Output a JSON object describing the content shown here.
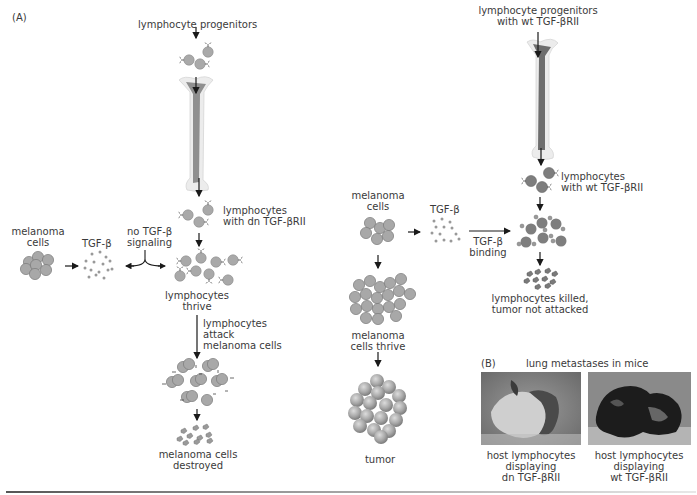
{
  "panel_a": {
    "label": "(A)",
    "progenitors": "lymphocyte progenitors",
    "lymphocytes_dn": [
      "lymphocytes",
      "with dn TGF-βRII"
    ],
    "melanoma_cells": [
      "melanoma",
      "cells"
    ],
    "tgf_beta": "TGF-β",
    "no_signaling": [
      "no TGF-β",
      "signaling"
    ],
    "thrive": [
      "lymphocytes",
      "thrive"
    ],
    "attack": [
      "lymphocytes",
      "attack",
      "melanoma cells"
    ],
    "destroyed": [
      "melanoma cells",
      "destroyed"
    ]
  },
  "panel_a_right": {
    "progenitors": [
      "lymphocyte progenitors",
      "with wt TGF-βRII"
    ],
    "lymphocytes_wt": [
      "lymphocytes",
      "with wt TGF-βRII"
    ],
    "melanoma_cells": [
      "melanoma",
      "cells"
    ],
    "tgf_beta": "TGF-β",
    "binding": [
      "TGF-β",
      "binding"
    ],
    "killed": [
      "lymphocytes killed,",
      "tumor not attacked"
    ],
    "thrive": [
      "melanoma",
      "cells thrive"
    ],
    "tumor": "tumor"
  },
  "panel_b": {
    "label": "(B)",
    "title": "lung metastases in mice",
    "captions": [
      [
        "host lymphocytes",
        "displaying",
        "dn TGF-βRII"
      ],
      [
        "host lymphocytes",
        "displaying",
        "wt TGF-βRII"
      ]
    ]
  },
  "colors": {
    "cell_light": "#a9a9a9",
    "cell_dark": "#7e7e7e",
    "bone_outer": "#ececec",
    "bone_inner": "#8c8c8c",
    "arrow": "#1a1a1a"
  }
}
